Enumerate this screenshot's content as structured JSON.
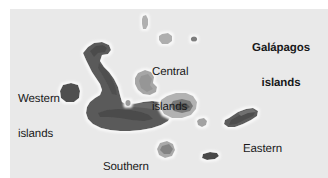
{
  "figure": {
    "kind": "map",
    "region": "Galápagos archipelago",
    "title": {
      "line1": "Galápagos",
      "line2": "islands"
    },
    "background_color": "#ffffff",
    "ocean_color": "#e9e9e9",
    "land_color_dark": "#5a5a5a",
    "land_color_light": "#a9a9a9",
    "halo_color": "#f7f7f7",
    "label_color": "#19191a"
  },
  "labels": [
    {
      "id": "western",
      "line1": "Western",
      "line2": "islands"
    },
    {
      "id": "central",
      "line1": "Central",
      "line2": "islands"
    },
    {
      "id": "southern",
      "line1": "Southern",
      "line2": "islands"
    },
    {
      "id": "eastern",
      "line1": "Eastern",
      "line2": "islands"
    }
  ],
  "island_groups": [
    {
      "id": "western",
      "label": "Western islands",
      "tone": "dark",
      "members": [
        "large seahorse-shaped island",
        "small rounded island to the west"
      ]
    },
    {
      "id": "central",
      "label": "Central islands",
      "tone": "light",
      "members": [
        "narrow sliver island (north)",
        "small round island (north)",
        "tiny dot island (north-east)",
        "medium island (west of centre)",
        "large central island with darker interior",
        "small dot island (west)",
        "small island (south-east of centre)"
      ]
    },
    {
      "id": "southern",
      "label": "Southern islands",
      "tone": "mixed",
      "members": [
        "broad southern mass of the large island",
        "small rounded light island"
      ]
    },
    {
      "id": "eastern",
      "label": "Eastern islands",
      "tone": "dark",
      "members": [
        "elongated eastern island",
        "small dark island (far south-east)"
      ]
    }
  ]
}
